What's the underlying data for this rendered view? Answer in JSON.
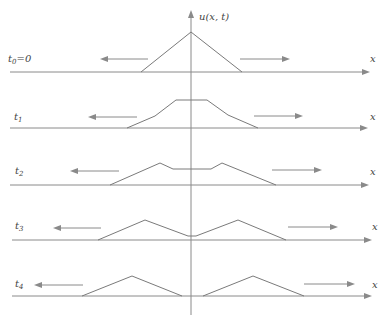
{
  "figure": {
    "vertical_axis_label": "u(x, t)",
    "horizontal_axis_label": "x",
    "colors": {
      "lines": "#8a8a8a",
      "text": "#444444",
      "background": "#ffffff"
    },
    "rows": [
      {
        "label": "t",
        "subscript": "0",
        "suffix": "=0",
        "baseline_y": 72,
        "axis_x": [
          10,
          370
        ],
        "profile": [
          [
            141,
            72
          ],
          [
            191,
            32
          ],
          [
            242,
            72
          ]
        ],
        "left_arrow": {
          "from": 148,
          "to": 100,
          "y": 59
        },
        "right_arrow": {
          "from": 240,
          "to": 290,
          "y": 59
        },
        "x_label_pos": [
          370,
          62
        ],
        "t_label_pos": [
          8,
          62
        ]
      },
      {
        "label": "t",
        "subscript": "1",
        "suffix": "",
        "baseline_y": 128,
        "axis_x": [
          10,
          368
        ],
        "profile": [
          [
            127,
            128
          ],
          [
            155,
            116
          ],
          [
            176,
            100
          ],
          [
            207,
            100
          ],
          [
            228,
            115
          ],
          [
            258,
            128
          ]
        ],
        "left_arrow": {
          "from": 137,
          "to": 88,
          "y": 117
        },
        "right_arrow": {
          "from": 254,
          "to": 303,
          "y": 116
        },
        "x_label_pos": [
          370,
          120
        ],
        "t_label_pos": [
          14,
          120
        ]
      },
      {
        "label": "t",
        "subscript": "2",
        "suffix": "",
        "baseline_y": 185,
        "axis_x": [
          10,
          369
        ],
        "profile": [
          [
            110,
            185
          ],
          [
            160,
            163
          ],
          [
            173,
            169
          ],
          [
            211,
            169
          ],
          [
            222,
            163
          ],
          [
            276,
            185
          ]
        ],
        "left_arrow": {
          "from": 119,
          "to": 70,
          "y": 171
        },
        "right_arrow": {
          "from": 272,
          "to": 322,
          "y": 170
        },
        "x_label_pos": [
          370,
          175
        ],
        "t_label_pos": [
          15,
          174
        ]
      },
      {
        "label": "t",
        "subscript": "3",
        "suffix": "",
        "baseline_y": 240,
        "axis_x": [
          12,
          372
        ],
        "profile": [
          [
            98,
            240
          ],
          [
            145,
            220
          ],
          [
            188,
            236
          ],
          [
            196,
            236
          ],
          [
            238,
            220
          ],
          [
            286,
            240
          ]
        ],
        "left_arrow": {
          "from": 101,
          "to": 53,
          "y": 228
        },
        "right_arrow": {
          "from": 288,
          "to": 338,
          "y": 227
        },
        "x_label_pos": [
          372,
          230
        ],
        "t_label_pos": [
          15,
          229
        ]
      },
      {
        "label": "t",
        "subscript": "4",
        "suffix": "",
        "baseline_y": 296,
        "axis_x": [
          12,
          372
        ],
        "profile_left": [
          [
            82,
            296
          ],
          [
            132,
            276
          ],
          [
            182,
            296
          ]
        ],
        "profile_right": [
          [
            203,
            296
          ],
          [
            253,
            276
          ],
          [
            304,
            296
          ]
        ],
        "left_arrow": {
          "from": 83,
          "to": 34,
          "y": 285
        },
        "right_arrow": {
          "from": 304,
          "to": 355,
          "y": 284
        },
        "x_label_pos": [
          372,
          288
        ],
        "t_label_pos": [
          15,
          287
        ]
      }
    ],
    "vertical_axis": {
      "x": 191,
      "top": 10,
      "bottom": 315
    }
  }
}
